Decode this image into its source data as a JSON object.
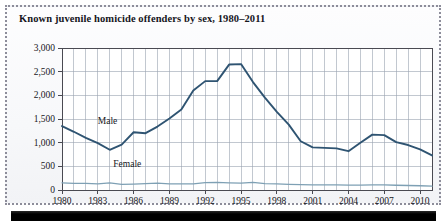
{
  "figure": {
    "title": "Known juvenile homicide offenders by sex, 1980–2011",
    "frame_style": "dotted",
    "frame_color": "#8d8d9a",
    "background": "#f7f8fa"
  },
  "chart_data": {
    "type": "line",
    "title": "Known juvenile homicide offenders by sex, 1980–2011",
    "xlabel": "",
    "ylabel": "",
    "xlim": [
      1980,
      2011
    ],
    "ylim": [
      0,
      3000
    ],
    "ytick_labels": [
      "0",
      "500",
      "1,000",
      "1,500",
      "2,000",
      "2,500",
      "3,000"
    ],
    "ytick_values": [
      0,
      500,
      1000,
      1500,
      2000,
      2500,
      3000
    ],
    "xtick_labels": [
      "1980",
      "1983",
      "1986",
      "1989",
      "1992",
      "1995",
      "1998",
      "2001",
      "2004",
      "2007",
      "2010"
    ],
    "xtick_values": [
      1980,
      1983,
      1986,
      1989,
      1992,
      1995,
      1998,
      2001,
      2004,
      2007,
      2010
    ],
    "grid": "both",
    "grid_color": "#9aa3b0",
    "legend_position": "inline-annotation",
    "x": [
      1980,
      1981,
      1982,
      1983,
      1984,
      1985,
      1986,
      1987,
      1988,
      1989,
      1990,
      1991,
      1992,
      1993,
      1994,
      1995,
      1996,
      1997,
      1998,
      1999,
      2000,
      2001,
      2002,
      2003,
      2004,
      2005,
      2006,
      2007,
      2008,
      2009,
      2010,
      2011
    ],
    "series": [
      {
        "name": "Male",
        "color": "#2f5472",
        "label_text": "Male",
        "values": [
          1350,
          1230,
          1100,
          990,
          850,
          960,
          1220,
          1200,
          1340,
          1510,
          1700,
          2100,
          2300,
          2300,
          2650,
          2660,
          2280,
          1950,
          1650,
          1380,
          1030,
          900,
          890,
          880,
          820,
          1000,
          1170,
          1160,
          1010,
          950,
          860,
          730
        ]
      },
      {
        "name": "Female",
        "color": "#7ea0b4",
        "label_text": "Female",
        "values": [
          150,
          140,
          140,
          130,
          150,
          120,
          125,
          135,
          145,
          130,
          130,
          130,
          155,
          160,
          150,
          145,
          160,
          135,
          130,
          120,
          115,
          110,
          110,
          110,
          105,
          105,
          110,
          110,
          100,
          95,
          90,
          80
        ]
      }
    ],
    "annotations": [
      {
        "text": "Male",
        "x": 1983.0,
        "y": 1430
      },
      {
        "text": "Female",
        "x": 1984.3,
        "y": 530
      }
    ]
  },
  "bottom_bar": {
    "color": "#000000"
  }
}
